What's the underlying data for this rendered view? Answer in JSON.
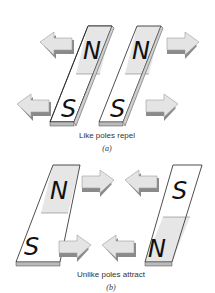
{
  "panels": [
    {
      "id": "a",
      "caption": "Like poles repel",
      "sublabel": "(a)",
      "magnets": [
        {
          "top": "N",
          "bottom": "S"
        },
        {
          "top": "N",
          "bottom": "S"
        }
      ],
      "arrows": [
        "left",
        "left",
        "right",
        "right"
      ]
    },
    {
      "id": "b",
      "caption": "Unlike poles attract",
      "sublabel": "(b)",
      "magnets": [
        {
          "top": "N",
          "bottom": "S"
        },
        {
          "top": "S",
          "bottom": "N"
        }
      ],
      "arrows": [
        "right",
        "left",
        "right",
        "left"
      ]
    }
  ],
  "colors": {
    "north_fill": "#e6e6e6",
    "south_fill": "#ffffff",
    "arrow_fill": "#e4e4e4",
    "arrow_shadow": "#8a8a8a",
    "outline": "#222222"
  }
}
